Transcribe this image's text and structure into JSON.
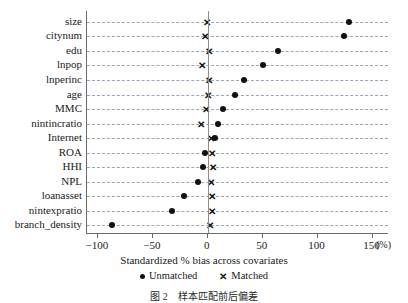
{
  "chart_data": {
    "type": "scatter",
    "title": "",
    "xlabel": "Standardized % bias across covariates",
    "ylabel": "",
    "unit_label": "(%)",
    "xlim": [
      -110,
      165
    ],
    "xticks": [
      -100,
      -50,
      0,
      50,
      100,
      150
    ],
    "xtick_labels": [
      "−100",
      "−50",
      "0",
      "50",
      "100",
      "150"
    ],
    "grid": "horizontal-dashed",
    "legend_position": "below-axis-centered",
    "zero_reference_line": 0,
    "categories": [
      "size",
      "citynum",
      "edu",
      "lnpop",
      "lnperinc",
      "age",
      "MMC",
      "nintincratio",
      "Internet",
      "ROA",
      "HHI",
      "NPL",
      "loanasset",
      "nintexpratio",
      "branch_density"
    ],
    "series": [
      {
        "name": "Unmatched",
        "marker": "circle",
        "color": "#111111",
        "values": [
          129,
          124,
          64,
          50,
          33,
          25,
          14,
          9,
          7,
          -3,
          -4,
          -9,
          -22,
          -33,
          -87
        ]
      },
      {
        "name": "Matched",
        "marker": "x",
        "color": "#111111",
        "values": [
          -1,
          -3,
          1,
          -5,
          1,
          0,
          -2,
          -6,
          3,
          4,
          5,
          3,
          4,
          4,
          2
        ]
      }
    ]
  },
  "legend": {
    "items": [
      {
        "label": "Unmatched",
        "marker": "dot-icon"
      },
      {
        "label": "Matched",
        "marker": "x-icon"
      }
    ]
  },
  "caption": "图 2　样本匹配前后偏差"
}
